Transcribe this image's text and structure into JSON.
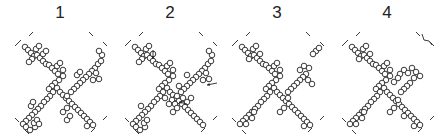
{
  "figure": {
    "panels": [
      {
        "label": "1",
        "x": 5
      },
      {
        "label": "2",
        "x": 115
      },
      {
        "label": "3",
        "x": 222
      },
      {
        "label": "4",
        "x": 332
      }
    ],
    "colors": {
      "stroke": "#222222",
      "background": "#ffffff"
    },
    "circle_radius": 2.8
  },
  "shapes": {
    "p1": [
      [
        18,
        19
      ],
      [
        21,
        22
      ],
      [
        24,
        25
      ],
      [
        27,
        28
      ],
      [
        30,
        27
      ],
      [
        33,
        30
      ],
      [
        36,
        33
      ],
      [
        39,
        36
      ],
      [
        42,
        37
      ],
      [
        45,
        40
      ],
      [
        48,
        43
      ],
      [
        51,
        46
      ],
      [
        29,
        21
      ],
      [
        32,
        18
      ],
      [
        25,
        31
      ],
      [
        22,
        34
      ],
      [
        36,
        26
      ],
      [
        39,
        23
      ],
      [
        50,
        38
      ],
      [
        53,
        35
      ],
      [
        56,
        42
      ],
      [
        56,
        48
      ],
      [
        52,
        52
      ],
      [
        48,
        55
      ],
      [
        45,
        58
      ],
      [
        42,
        61
      ],
      [
        46,
        64
      ],
      [
        43,
        68
      ],
      [
        40,
        71
      ],
      [
        37,
        74
      ],
      [
        34,
        78
      ],
      [
        31,
        81
      ],
      [
        28,
        84
      ],
      [
        25,
        87
      ],
      [
        22,
        90
      ],
      [
        19,
        93
      ],
      [
        16,
        96
      ],
      [
        19,
        99
      ],
      [
        23,
        102
      ],
      [
        28,
        99
      ],
      [
        27,
        95
      ],
      [
        30,
        92
      ],
      [
        32,
        96
      ],
      [
        24,
        78
      ],
      [
        26,
        74
      ],
      [
        50,
        60
      ],
      [
        53,
        64
      ],
      [
        56,
        67
      ],
      [
        59,
        70
      ],
      [
        62,
        73
      ],
      [
        65,
        76
      ],
      [
        68,
        79
      ],
      [
        71,
        82
      ],
      [
        74,
        85
      ],
      [
        77,
        88
      ],
      [
        80,
        91
      ],
      [
        83,
        94
      ],
      [
        86,
        97
      ],
      [
        80,
        98
      ],
      [
        88,
        40
      ],
      [
        85,
        43
      ],
      [
        82,
        46
      ],
      [
        79,
        49
      ],
      [
        76,
        52
      ],
      [
        73,
        55
      ],
      [
        70,
        58
      ],
      [
        67,
        61
      ],
      [
        64,
        64
      ],
      [
        70,
        47
      ],
      [
        73,
        44
      ],
      [
        91,
        36
      ],
      [
        94,
        33
      ],
      [
        95,
        27
      ],
      [
        92,
        23
      ],
      [
        89,
        45
      ],
      [
        86,
        52
      ],
      [
        92,
        51
      ],
      [
        60,
        68
      ],
      [
        60,
        80
      ],
      [
        56,
        84
      ],
      [
        60,
        92
      ],
      [
        63,
        88
      ]
    ],
    "p2": [
      [
        18,
        19
      ],
      [
        21,
        22
      ],
      [
        24,
        25
      ],
      [
        27,
        28
      ],
      [
        30,
        27
      ],
      [
        33,
        30
      ],
      [
        36,
        33
      ],
      [
        39,
        36
      ],
      [
        42,
        37
      ],
      [
        45,
        40
      ],
      [
        48,
        43
      ],
      [
        51,
        46
      ],
      [
        29,
        21
      ],
      [
        32,
        18
      ],
      [
        25,
        31
      ],
      [
        22,
        34
      ],
      [
        36,
        26
      ],
      [
        50,
        38
      ],
      [
        53,
        35
      ],
      [
        56,
        42
      ],
      [
        56,
        48
      ],
      [
        52,
        52
      ],
      [
        48,
        55
      ],
      [
        45,
        58
      ],
      [
        42,
        61
      ],
      [
        46,
        64
      ],
      [
        43,
        68
      ],
      [
        40,
        71
      ],
      [
        37,
        74
      ],
      [
        34,
        78
      ],
      [
        31,
        81
      ],
      [
        28,
        84
      ],
      [
        25,
        87
      ],
      [
        22,
        90
      ],
      [
        19,
        93
      ],
      [
        16,
        96
      ],
      [
        19,
        99
      ],
      [
        23,
        102
      ],
      [
        28,
        99
      ],
      [
        27,
        95
      ],
      [
        30,
        92
      ],
      [
        24,
        78
      ],
      [
        50,
        60
      ],
      [
        53,
        64
      ],
      [
        56,
        67
      ],
      [
        59,
        70
      ],
      [
        62,
        73
      ],
      [
        65,
        76
      ],
      [
        68,
        79
      ],
      [
        71,
        82
      ],
      [
        74,
        85
      ],
      [
        77,
        88
      ],
      [
        80,
        91
      ],
      [
        83,
        94
      ],
      [
        86,
        97
      ],
      [
        88,
        40
      ],
      [
        85,
        43
      ],
      [
        82,
        46
      ],
      [
        79,
        49
      ],
      [
        76,
        52
      ],
      [
        73,
        55
      ],
      [
        70,
        58
      ],
      [
        67,
        61
      ],
      [
        64,
        64
      ],
      [
        70,
        47
      ],
      [
        91,
        36
      ],
      [
        94,
        33
      ],
      [
        95,
        27
      ],
      [
        92,
        23
      ],
      [
        89,
        45
      ],
      [
        86,
        52
      ],
      [
        92,
        51
      ],
      [
        60,
        68
      ],
      [
        55,
        72
      ],
      [
        58,
        76
      ],
      [
        52,
        76
      ],
      [
        48,
        70
      ],
      [
        62,
        58
      ],
      [
        66,
        70
      ],
      [
        60,
        80
      ],
      [
        56,
        84
      ],
      [
        70,
        74
      ],
      [
        74,
        70
      ]
    ],
    "p3": [
      [
        18,
        19
      ],
      [
        21,
        22
      ],
      [
        24,
        25
      ],
      [
        27,
        28
      ],
      [
        30,
        27
      ],
      [
        33,
        30
      ],
      [
        36,
        33
      ],
      [
        39,
        36
      ],
      [
        42,
        37
      ],
      [
        45,
        40
      ],
      [
        48,
        43
      ],
      [
        51,
        46
      ],
      [
        29,
        21
      ],
      [
        32,
        18
      ],
      [
        25,
        31
      ],
      [
        36,
        26
      ],
      [
        50,
        38
      ],
      [
        53,
        35
      ],
      [
        56,
        42
      ],
      [
        56,
        48
      ],
      [
        52,
        52
      ],
      [
        48,
        55
      ],
      [
        45,
        58
      ],
      [
        42,
        61
      ],
      [
        46,
        64
      ],
      [
        43,
        68
      ],
      [
        40,
        71
      ],
      [
        37,
        74
      ],
      [
        34,
        78
      ],
      [
        31,
        81
      ],
      [
        28,
        84
      ],
      [
        25,
        87
      ],
      [
        22,
        90
      ],
      [
        19,
        93
      ],
      [
        16,
        96
      ],
      [
        22,
        96
      ],
      [
        28,
        90
      ],
      [
        30,
        84
      ],
      [
        50,
        60
      ],
      [
        53,
        64
      ],
      [
        56,
        67
      ],
      [
        59,
        70
      ],
      [
        62,
        73
      ],
      [
        65,
        76
      ],
      [
        68,
        79
      ],
      [
        71,
        82
      ],
      [
        74,
        85
      ],
      [
        77,
        88
      ],
      [
        80,
        91
      ],
      [
        83,
        94
      ],
      [
        86,
        97
      ],
      [
        80,
        98
      ],
      [
        82,
        46
      ],
      [
        79,
        49
      ],
      [
        76,
        52
      ],
      [
        73,
        55
      ],
      [
        70,
        58
      ],
      [
        67,
        61
      ],
      [
        64,
        64
      ],
      [
        76,
        42
      ],
      [
        80,
        38
      ],
      [
        85,
        40
      ],
      [
        84,
        52
      ],
      [
        88,
        56
      ],
      [
        92,
        23
      ],
      [
        95,
        20
      ],
      [
        89,
        26
      ],
      [
        60,
        80
      ],
      [
        56,
        84
      ],
      [
        64,
        70
      ]
    ],
    "p4": [
      [
        18,
        19
      ],
      [
        21,
        22
      ],
      [
        24,
        25
      ],
      [
        27,
        28
      ],
      [
        30,
        27
      ],
      [
        33,
        30
      ],
      [
        36,
        33
      ],
      [
        39,
        36
      ],
      [
        42,
        37
      ],
      [
        45,
        40
      ],
      [
        48,
        43
      ],
      [
        51,
        46
      ],
      [
        29,
        21
      ],
      [
        32,
        18
      ],
      [
        25,
        31
      ],
      [
        36,
        26
      ],
      [
        50,
        38
      ],
      [
        53,
        35
      ],
      [
        56,
        42
      ],
      [
        56,
        48
      ],
      [
        52,
        52
      ],
      [
        48,
        55
      ],
      [
        45,
        58
      ],
      [
        42,
        61
      ],
      [
        46,
        64
      ],
      [
        43,
        68
      ],
      [
        40,
        71
      ],
      [
        37,
        74
      ],
      [
        34,
        78
      ],
      [
        31,
        81
      ],
      [
        28,
        84
      ],
      [
        25,
        87
      ],
      [
        22,
        90
      ],
      [
        19,
        93
      ],
      [
        16,
        96
      ],
      [
        22,
        96
      ],
      [
        28,
        90
      ],
      [
        30,
        84
      ],
      [
        50,
        60
      ],
      [
        53,
        64
      ],
      [
        56,
        67
      ],
      [
        59,
        70
      ],
      [
        62,
        73
      ],
      [
        65,
        76
      ],
      [
        68,
        79
      ],
      [
        71,
        82
      ],
      [
        74,
        85
      ],
      [
        77,
        88
      ],
      [
        80,
        91
      ],
      [
        83,
        94
      ],
      [
        86,
        97
      ],
      [
        80,
        98
      ],
      [
        70,
        42
      ],
      [
        66,
        46
      ],
      [
        74,
        45
      ],
      [
        78,
        40
      ],
      [
        82,
        44
      ],
      [
        86,
        48
      ],
      [
        80,
        50
      ],
      [
        76,
        55
      ],
      [
        73,
        58
      ],
      [
        70,
        61
      ],
      [
        67,
        64
      ],
      [
        60,
        54
      ],
      [
        64,
        50
      ],
      [
        60,
        80
      ],
      [
        56,
        84
      ],
      [
        64,
        72
      ],
      [
        70,
        88
      ]
    ]
  },
  "panel2_arrows": [
    [
      36,
      22,
      36,
      31
    ],
    [
      100,
      55,
      90,
      57
    ],
    [
      70,
      76,
      62,
      74
    ]
  ]
}
